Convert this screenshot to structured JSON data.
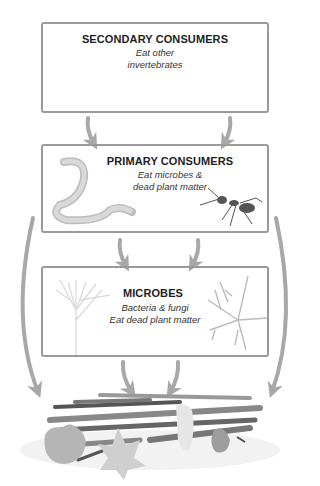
{
  "diagram": {
    "type": "food-web",
    "levels": [
      {
        "id": "secondary",
        "title": "SECONDARY CONSUMERS",
        "lines": [
          "Eat other",
          "invertebrates"
        ],
        "organisms": [
          "beetle",
          "centipede"
        ]
      },
      {
        "id": "primary",
        "title": "PRIMARY CONSUMERS",
        "lines": [
          "Eat microbes &",
          "dead plant matter"
        ],
        "organisms": [
          "earthworm",
          "ant"
        ]
      },
      {
        "id": "microbes",
        "title": "MICROBES",
        "lines": [
          "Bacteria & fungi",
          "Eat dead plant matter"
        ],
        "organisms": [
          "bacteria",
          "fungal-hyphae"
        ]
      }
    ],
    "sink": {
      "id": "dead-plant-matter",
      "label": "leaf litter & twigs"
    },
    "edges": [
      {
        "from": "secondary",
        "to": "primary"
      },
      {
        "from": "secondary",
        "to": "primary"
      },
      {
        "from": "primary",
        "to": "microbes"
      },
      {
        "from": "primary",
        "to": "microbes"
      },
      {
        "from": "microbes",
        "to": "dead-plant-matter"
      },
      {
        "from": "microbes",
        "to": "dead-plant-matter"
      },
      {
        "from": "primary",
        "to": "dead-plant-matter"
      },
      {
        "from": "primary",
        "to": "dead-plant-matter"
      }
    ],
    "colors": {
      "border": "#9a9a9a",
      "arrow": "#a8a8a8",
      "text": "#1e1e1e",
      "organism": "#6b6b6b"
    }
  }
}
